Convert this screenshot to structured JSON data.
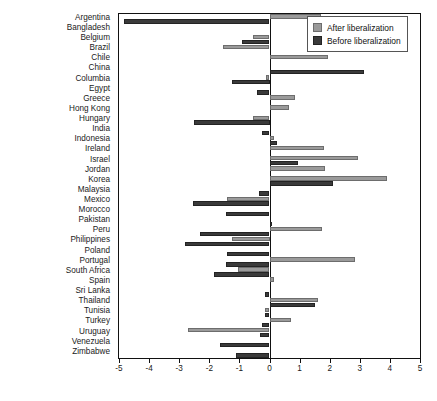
{
  "chart_data": {
    "type": "bar",
    "orientation": "horizontal",
    "title": "",
    "xlabel": "",
    "ylabel": "",
    "xlim": [
      -5,
      5
    ],
    "xticks": [
      -5,
      -4,
      -3,
      -2,
      -1,
      0,
      1,
      2,
      3,
      4,
      5
    ],
    "xticklabels": [
      "-5",
      "-4",
      "-3",
      "-2",
      "-1",
      "0",
      "1",
      "2",
      "3",
      "4",
      "5"
    ],
    "grid": false,
    "legend_position": "top-right",
    "categories": [
      "Argentina",
      "Bangladesh",
      "Belgium",
      "Brazil",
      "Chile",
      "China",
      "Columbia",
      "Egypt",
      "Greece",
      "Hong Kong",
      "Hungary",
      "India",
      "Indonesia",
      "Ireland",
      "Israel",
      "Jordan",
      "Korea",
      "Malaysia",
      "Mexico",
      "Morocco",
      "Pakistan",
      "Peru",
      "Philippines",
      "Poland",
      "Portugal",
      "South Africa",
      "Spain",
      "Sri Lanka",
      "Thailand",
      "Tunisia",
      "Turkey",
      "Uruguay",
      "Venezuela",
      "Zimbabwe"
    ],
    "series": [
      {
        "name": "After liberalization",
        "color": "#9a9a9a",
        "values": [
          1.7,
          0.0,
          -0.55,
          -1.55,
          1.95,
          0.0,
          -0.1,
          0.0,
          0.85,
          0.65,
          -0.55,
          0.0,
          0.15,
          1.8,
          2.95,
          1.85,
          3.9,
          0.0,
          -1.4,
          0.0,
          0.0,
          1.75,
          -1.25,
          0.0,
          2.85,
          -1.05,
          0.15,
          0.0,
          1.6,
          -0.15,
          0.7,
          -2.7,
          0.0,
          0.0
        ]
      },
      {
        "name": "Before liberalization",
        "color": "#3a3a3a",
        "values": [
          -4.85,
          0.0,
          -0.9,
          0.0,
          0.0,
          3.15,
          -1.25,
          -0.4,
          0.0,
          0.0,
          -2.5,
          -0.25,
          0.25,
          0.0,
          0.95,
          0.0,
          2.1,
          -0.35,
          -2.55,
          -1.45,
          0.05,
          -2.3,
          -2.8,
          -1.4,
          -1.45,
          -1.85,
          0.0,
          -0.15,
          1.5,
          -0.15,
          -0.25,
          -0.3,
          -1.65,
          -1.1
        ]
      }
    ]
  },
  "legend": {
    "items": [
      {
        "label": "After liberalization",
        "key": "after"
      },
      {
        "label": "Before liberalization",
        "key": "before"
      }
    ]
  }
}
